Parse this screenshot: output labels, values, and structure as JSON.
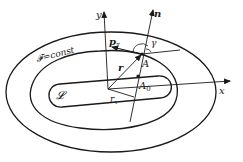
{
  "labels": {
    "y_axis": "y",
    "x_axis": "x",
    "normal": "n",
    "momentum_tangent": "p",
    "momentum_tangent_sub": "τ",
    "gamma": "γ",
    "point_A": "A",
    "point_A0": "A",
    "point_A0_sub": "0",
    "radius": "r",
    "r_tau": "r",
    "r_tau_sub": "τ",
    "level_set": "𝓕=const",
    "region": "𝓛"
  },
  "colors": {
    "ink": "#1a1a1a",
    "background": "#ffffff"
  }
}
